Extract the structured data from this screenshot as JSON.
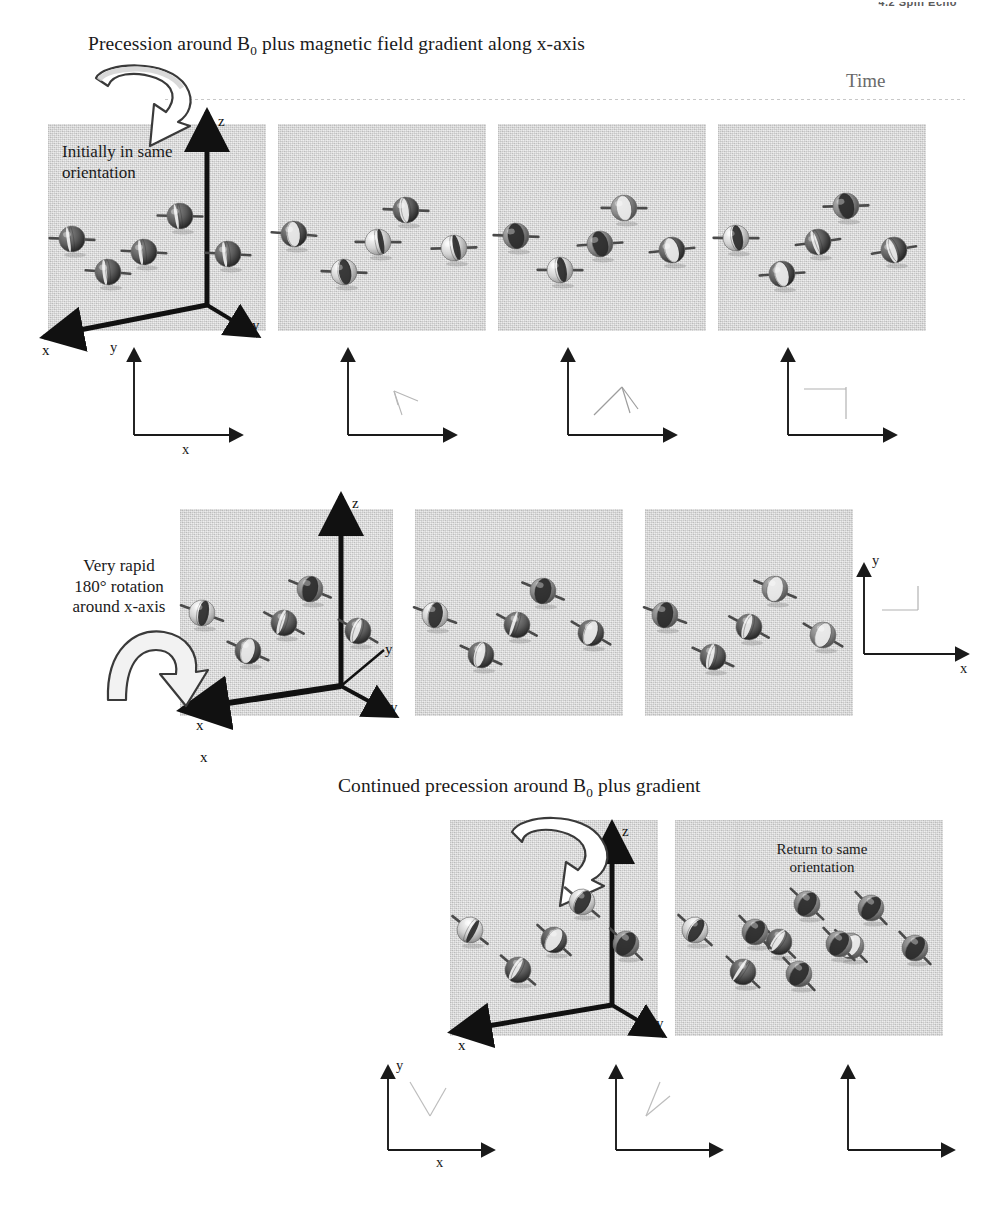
{
  "page": {
    "running_header": "4.2  Spin Echo",
    "width": 987,
    "height": 1212,
    "paper_color": "#ffffff",
    "panel_color": "#d9d9d9",
    "ink_color": "#1a1a1a"
  },
  "headings": {
    "row1": {
      "text_before": "Precession around B",
      "subscript": "0",
      "text_after": " plus magnetic field gradient along x-axis"
    },
    "row3": {
      "text_before": "Continued precession around B",
      "subscript": "0",
      "text_after": " plus gradient"
    }
  },
  "timeline": {
    "label": "Time"
  },
  "annotations": {
    "initially": {
      "line1": "Initially in same",
      "line2": "orientation"
    },
    "rapid_rotation": {
      "line1": "Very rapid",
      "line2": "180° rotation",
      "line3": "around x-axis"
    },
    "return": {
      "line1": "Return to same",
      "line2": "orientation"
    }
  },
  "axes3d": {
    "x": "x",
    "y": "y",
    "z": "z",
    "y_inner": "y"
  },
  "axes2d": {
    "x": "x",
    "y": "y"
  },
  "rows": [
    {
      "id": "row-1",
      "heading_key": "headings.row1",
      "panels": [
        {
          "id": "r1p1",
          "has_axes3d": true,
          "has_curved_arrow": true,
          "curved_arrow_direction": "counter-clockwise-top-left",
          "annotation": "initially",
          "spins": [
            {
              "cx": 24,
              "cy": 115,
              "angle_deg": 0,
              "phase_deg": 12,
              "tilt_deg": -8
            },
            {
              "cx": 60,
              "cy": 148,
              "angle_deg": 0,
              "phase_deg": 16,
              "tilt_deg": -6
            },
            {
              "cx": 96,
              "cy": 128,
              "angle_deg": 0,
              "phase_deg": 14,
              "tilt_deg": -7
            },
            {
              "cx": 132,
              "cy": 92,
              "angle_deg": 0,
              "phase_deg": 10,
              "tilt_deg": -9
            },
            {
              "cx": 180,
              "cy": 130,
              "angle_deg": 0,
              "phase_deg": 15,
              "tilt_deg": -7
            }
          ]
        },
        {
          "id": "r1p2",
          "has_axes3d": false,
          "annotation": null,
          "spins": [
            {
              "cx": 16,
              "cy": 110,
              "angle_deg": 0,
              "phase_deg": 55,
              "tilt_deg": -6
            },
            {
              "cx": 66,
              "cy": 148,
              "angle_deg": 0,
              "phase_deg": 130,
              "tilt_deg": -8
            },
            {
              "cx": 100,
              "cy": 118,
              "angle_deg": 0,
              "phase_deg": 160,
              "tilt_deg": -10
            },
            {
              "cx": 128,
              "cy": 86,
              "angle_deg": 0,
              "phase_deg": 35,
              "tilt_deg": -8
            },
            {
              "cx": 176,
              "cy": 124,
              "angle_deg": 0,
              "phase_deg": 205,
              "tilt_deg": -12
            }
          ]
        },
        {
          "id": "r1p3",
          "has_axes3d": false,
          "annotation": null,
          "spins": [
            {
              "cx": 18,
              "cy": 112,
              "angle_deg": 0,
              "phase_deg": 95,
              "tilt_deg": -8
            },
            {
              "cx": 62,
              "cy": 146,
              "angle_deg": 0,
              "phase_deg": 215,
              "tilt_deg": -10
            },
            {
              "cx": 102,
              "cy": 120,
              "angle_deg": 0,
              "phase_deg": 250,
              "tilt_deg": -14
            },
            {
              "cx": 126,
              "cy": 84,
              "angle_deg": 0,
              "phase_deg": 70,
              "tilt_deg": -10
            },
            {
              "cx": 174,
              "cy": 126,
              "angle_deg": 0,
              "phase_deg": 300,
              "tilt_deg": -16
            }
          ]
        },
        {
          "id": "r1p4",
          "has_axes3d": false,
          "annotation": null,
          "spins": [
            {
              "cx": 18,
              "cy": 114,
              "angle_deg": 0,
              "phase_deg": 140,
              "tilt_deg": -10
            },
            {
              "cx": 64,
              "cy": 150,
              "angle_deg": 0,
              "phase_deg": 300,
              "tilt_deg": -14
            },
            {
              "cx": 100,
              "cy": 118,
              "angle_deg": 0,
              "phase_deg": 340,
              "tilt_deg": -18
            },
            {
              "cx": 128,
              "cy": 82,
              "angle_deg": 0,
              "phase_deg": 110,
              "tilt_deg": -12
            },
            {
              "cx": 176,
              "cy": 126,
              "angle_deg": 0,
              "phase_deg": 30,
              "tilt_deg": -20
            }
          ]
        }
      ],
      "insets": [
        {
          "id": "r1i1",
          "fan": []
        },
        {
          "id": "r1i2",
          "fan": [
            -38,
            -62,
            -78
          ]
        },
        {
          "id": "r1i3",
          "fan": [
            -30,
            -75,
            -120
          ]
        },
        {
          "id": "r1i4",
          "fan": [
            -10,
            -90,
            -170
          ]
        }
      ],
      "inset_labels": {
        "x": "x",
        "y": "y"
      }
    },
    {
      "id": "row-2",
      "heading_key": null,
      "annotation": "rapid_rotation",
      "has_flip_arrow": true,
      "panels": [
        {
          "id": "r2p1",
          "has_axes3d": true,
          "spins": [
            {
              "cx": 22,
              "cy": 104,
              "angle_deg": 0,
              "phase_deg": 220,
              "tilt_deg": 10
            },
            {
              "cx": 68,
              "cy": 142,
              "angle_deg": 0,
              "phase_deg": 60,
              "tilt_deg": 14
            },
            {
              "cx": 104,
              "cy": 114,
              "angle_deg": 0,
              "phase_deg": 20,
              "tilt_deg": 18
            },
            {
              "cx": 130,
              "cy": 80,
              "angle_deg": 0,
              "phase_deg": 250,
              "tilt_deg": 12
            },
            {
              "cx": 178,
              "cy": 122,
              "angle_deg": 0,
              "phase_deg": 330,
              "tilt_deg": 20
            }
          ]
        },
        {
          "id": "r2p2",
          "has_axes3d": false,
          "spins": [
            {
              "cx": 20,
              "cy": 106,
              "angle_deg": 0,
              "phase_deg": 240,
              "tilt_deg": 10
            },
            {
              "cx": 66,
              "cy": 146,
              "angle_deg": 0,
              "phase_deg": 40,
              "tilt_deg": 14
            },
            {
              "cx": 102,
              "cy": 116,
              "angle_deg": 0,
              "phase_deg": 350,
              "tilt_deg": 18
            },
            {
              "cx": 128,
              "cy": 82,
              "angle_deg": 0,
              "phase_deg": 265,
              "tilt_deg": 12
            },
            {
              "cx": 176,
              "cy": 124,
              "angle_deg": 0,
              "phase_deg": 305,
              "tilt_deg": 20
            }
          ]
        },
        {
          "id": "r2p3",
          "has_axes3d": false,
          "spins": [
            {
              "cx": 20,
              "cy": 106,
              "angle_deg": 0,
              "phase_deg": 255,
              "tilt_deg": 10
            },
            {
              "cx": 68,
              "cy": 148,
              "angle_deg": 0,
              "phase_deg": 25,
              "tilt_deg": 14
            },
            {
              "cx": 104,
              "cy": 118,
              "angle_deg": 0,
              "phase_deg": 330,
              "tilt_deg": 18
            },
            {
              "cx": 130,
              "cy": 80,
              "angle_deg": 0,
              "phase_deg": 275,
              "tilt_deg": 12
            },
            {
              "cx": 178,
              "cy": 126,
              "angle_deg": 0,
              "phase_deg": 290,
              "tilt_deg": 20
            }
          ]
        }
      ],
      "inset": {
        "id": "r2i1",
        "fan": [
          -88,
          -92
        ]
      }
    },
    {
      "id": "row-3",
      "heading_key": "headings.row3",
      "panels": [
        {
          "id": "r3p1",
          "has_axes3d": true,
          "has_curved_arrow": true,
          "curved_arrow_direction": "counter-clockwise-top-left",
          "spins": [
            {
              "cx": 20,
              "cy": 110,
              "angle_deg": 0,
              "phase_deg": 200,
              "tilt_deg": 28
            },
            {
              "cx": 68,
              "cy": 150,
              "angle_deg": 0,
              "phase_deg": 25,
              "tilt_deg": 30
            },
            {
              "cx": 104,
              "cy": 120,
              "angle_deg": 0,
              "phase_deg": 300,
              "tilt_deg": 32
            },
            {
              "cx": 132,
              "cy": 82,
              "angle_deg": 0,
              "phase_deg": 235,
              "tilt_deg": 30
            },
            {
              "cx": 176,
              "cy": 124,
              "angle_deg": 0,
              "phase_deg": 265,
              "tilt_deg": 34
            }
          ]
        },
        {
          "id": "r3p2",
          "has_axes3d": false,
          "spins": [
            {
              "cx": 20,
              "cy": 110,
              "angle_deg": 0,
              "phase_deg": 225,
              "tilt_deg": 32
            },
            {
              "cx": 68,
              "cy": 152,
              "angle_deg": 0,
              "phase_deg": 10,
              "tilt_deg": 33
            },
            {
              "cx": 104,
              "cy": 122,
              "angle_deg": 0,
              "phase_deg": 330,
              "tilt_deg": 34
            },
            {
              "cx": 132,
              "cy": 84,
              "angle_deg": 0,
              "phase_deg": 250,
              "tilt_deg": 33
            },
            {
              "cx": 176,
              "cy": 126,
              "angle_deg": 0,
              "phase_deg": 280,
              "tilt_deg": 35
            }
          ]
        },
        {
          "id": "r3p3",
          "annotation": "return",
          "has_axes3d": false,
          "spins": [
            {
              "cx": 20,
              "cy": 112,
              "angle_deg": 0,
              "phase_deg": 250,
              "tilt_deg": 36
            },
            {
              "cx": 64,
              "cy": 154,
              "angle_deg": 0,
              "phase_deg": 250,
              "tilt_deg": 36
            },
            {
              "cx": 104,
              "cy": 124,
              "angle_deg": 0,
              "phase_deg": 250,
              "tilt_deg": 36
            },
            {
              "cx": 136,
              "cy": 88,
              "angle_deg": 0,
              "phase_deg": 250,
              "tilt_deg": 36
            },
            {
              "cx": 180,
              "cy": 128,
              "angle_deg": 0,
              "phase_deg": 250,
              "tilt_deg": 36
            }
          ]
        }
      ],
      "insets": [
        {
          "id": "r3i1",
          "fan": [
            -50,
            -105
          ]
        },
        {
          "id": "r3i2",
          "fan": [
            -40,
            -70
          ]
        },
        {
          "id": "r3i3",
          "fan": []
        }
      ],
      "inset_labels": {
        "x": "x",
        "y": "y"
      }
    }
  ]
}
